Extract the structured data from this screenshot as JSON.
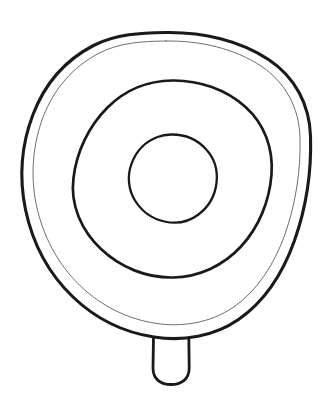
{
  "artwork": {
    "title": "Concentric ring disc with handle",
    "style": "coloring-book line art",
    "background_color": "#ffffff",
    "line_color": "#1a1a1a",
    "thin_line_color": "#5d5d5d",
    "canvas": {
      "width": 332,
      "height": 409
    },
    "shapes": [
      {
        "name": "outer-body-outline",
        "role": "outermost thick contour of the round body",
        "kind": "closed-blob",
        "bounds": {
          "x": 22,
          "y": 32,
          "width": 289,
          "height": 306
        },
        "center": {
          "x": 166,
          "y": 185
        },
        "stroke_width": 3.1,
        "stroke_color": "#1a1a1a"
      },
      {
        "name": "outer-body-inner-rim",
        "role": "thin line just inside the outer contour",
        "kind": "closed-blob",
        "bounds": {
          "x": 30,
          "y": 40,
          "width": 272,
          "height": 290
        },
        "center": {
          "x": 166,
          "y": 185
        },
        "stroke_width": 0.9,
        "stroke_color": "#5d5d5d"
      },
      {
        "name": "middle-ring",
        "role": "second concentric ring",
        "kind": "ellipse",
        "bounds": {
          "x": 74,
          "y": 80,
          "width": 196,
          "height": 198
        },
        "center": {
          "x": 172,
          "y": 179
        },
        "stroke_width": 2.7,
        "stroke_color": "#1a1a1a"
      },
      {
        "name": "inner-circle",
        "role": "innermost small circle",
        "kind": "ellipse",
        "bounds": {
          "x": 128,
          "y": 134,
          "width": 87,
          "height": 88
        },
        "center": {
          "x": 171,
          "y": 178
        },
        "stroke_width": 2.3,
        "stroke_color": "#1a1a1a"
      },
      {
        "name": "handle-stem",
        "role": "rounded rectangular handle below the body",
        "kind": "rounded-rect",
        "bounds": {
          "x": 152,
          "y": 330,
          "width": 38,
          "height": 54
        },
        "corner_radius": 17,
        "stroke_width": 2.8,
        "stroke_color": "#1a1a1a"
      }
    ]
  }
}
